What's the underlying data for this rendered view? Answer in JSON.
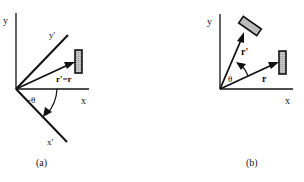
{
  "figure": {
    "panels": [
      {
        "id": "a",
        "caption": "(a)",
        "labels": {
          "y_axis": "y",
          "x_axis": "x",
          "y_prime_axis": "y'",
          "x_prime_axis": "x'",
          "vector": "r'=r",
          "angle": "-θ"
        },
        "description": "Passive rotation: coordinate axes rotated by -θ, object and vector unchanged"
      },
      {
        "id": "b",
        "caption": "(b)",
        "labels": {
          "y_axis": "y",
          "x_axis": "x",
          "vector_original": "r",
          "vector_rotated": "r'",
          "angle": "θ"
        },
        "description": "Active rotation: object and vector rotated by θ, axes unchanged"
      }
    ],
    "colors": {
      "stroke": "#111111",
      "object_fill": "#bdbdbd",
      "background": "#ffffff"
    }
  }
}
